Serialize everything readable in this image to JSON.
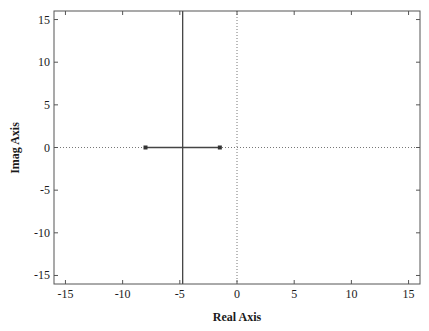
{
  "chart_data": {
    "type": "line",
    "title": "",
    "xlabel": "Real Axis",
    "ylabel": "Imag Axis",
    "xlim": [
      -16,
      16
    ],
    "ylim": [
      -16,
      16
    ],
    "grid": false,
    "xticks": [
      -15,
      -10,
      -5,
      0,
      5,
      10,
      15
    ],
    "yticks": [
      -15,
      -10,
      -5,
      0,
      5,
      10,
      15
    ],
    "xtick_labels": [
      "-15",
      "-10",
      "-5",
      "0",
      "5",
      "10",
      "15"
    ],
    "ytick_labels": [
      "-15",
      "-10",
      "-5",
      "0",
      "5",
      "10",
      "15"
    ],
    "series": [
      {
        "name": "root locus real-axis segment",
        "style": "solid",
        "x": [
          -8.0,
          -1.5
        ],
        "y": [
          0,
          0
        ]
      },
      {
        "name": "root locus asymptote branch",
        "style": "solid",
        "x": [
          -4.75,
          -4.75
        ],
        "y": [
          -16,
          16
        ]
      },
      {
        "name": "open-loop poles",
        "style": "markers",
        "marker": "square",
        "x": [
          -8.0,
          -1.5
        ],
        "y": [
          0,
          0
        ]
      }
    ],
    "reference_lines": [
      {
        "orientation": "horizontal",
        "value": 0,
        "style": "dotted"
      },
      {
        "orientation": "vertical",
        "value": 0,
        "style": "dotted"
      }
    ],
    "colors": {
      "axes": "#555555",
      "line": "#444444",
      "dotted": "#777777",
      "text": "#1a1a1a"
    }
  }
}
